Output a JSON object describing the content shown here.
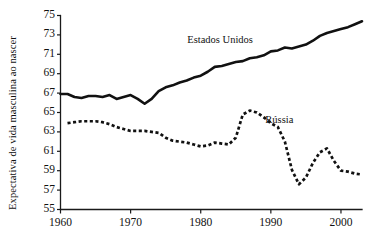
{
  "chart_data": {
    "type": "line",
    "title": "",
    "xlabel": "",
    "ylabel": "Expectativa de vida masculina ao nascer",
    "xlim": [
      1960,
      2003
    ],
    "ylim": [
      55,
      75
    ],
    "grid": false,
    "legend_position": "inline-annotation",
    "x_ticks": [
      "1960",
      "1970",
      "1980",
      "1990",
      "2000"
    ],
    "x_tick_values": [
      1960,
      1970,
      1980,
      1990,
      2000
    ],
    "y_ticks": [
      "55",
      "57",
      "59",
      "61",
      "63",
      "65",
      "67",
      "69",
      "71",
      "73",
      "75"
    ],
    "y_tick_values": [
      55,
      57,
      59,
      61,
      63,
      65,
      67,
      69,
      71,
      73,
      75
    ],
    "series": [
      {
        "name": "Estados Unidos",
        "style": "solid",
        "color": "#111111",
        "label_x": 1983.5,
        "label_y": 72.4,
        "x": [
          1960,
          1961,
          1962,
          1963,
          1964,
          1965,
          1966,
          1967,
          1968,
          1969,
          1970,
          1971,
          1972,
          1973,
          1974,
          1975,
          1976,
          1977,
          1978,
          1979,
          1980,
          1981,
          1982,
          1983,
          1984,
          1985,
          1986,
          1987,
          1988,
          1989,
          1990,
          1991,
          1992,
          1993,
          1994,
          1995,
          1996,
          1997,
          1998,
          1999,
          2000,
          2001,
          2002,
          2003
        ],
        "values": [
          66.9,
          66.9,
          66.6,
          66.5,
          66.7,
          66.7,
          66.6,
          66.8,
          66.4,
          66.6,
          66.8,
          66.4,
          65.9,
          66.4,
          67.2,
          67.6,
          67.8,
          68.1,
          68.3,
          68.6,
          68.8,
          69.2,
          69.7,
          69.8,
          70.0,
          70.2,
          70.3,
          70.6,
          70.7,
          70.9,
          71.3,
          71.4,
          71.7,
          71.6,
          71.8,
          72.0,
          72.4,
          72.9,
          73.2,
          73.4,
          73.6,
          73.8,
          74.1,
          74.4
        ],
        "start_value": 66.9,
        "end_value": 74.4,
        "min_value": 65.9,
        "max_value": 74.4
      },
      {
        "name": "Rússia",
        "style": "dashed",
        "color": "#111111",
        "label_x": 1991.5,
        "label_y": 64.1,
        "x": [
          1961,
          1962,
          1963,
          1964,
          1965,
          1966,
          1967,
          1968,
          1969,
          1970,
          1971,
          1972,
          1973,
          1974,
          1975,
          1976,
          1977,
          1978,
          1979,
          1980,
          1981,
          1982,
          1983,
          1984,
          1985,
          1986,
          1987,
          1988,
          1989,
          1990,
          1991,
          1992,
          1993,
          1994,
          1995,
          1996,
          1997,
          1998,
          1999,
          2000,
          2001,
          2002,
          2003
        ],
        "values": [
          63.9,
          64.0,
          64.1,
          64.1,
          64.1,
          64.0,
          63.8,
          63.5,
          63.3,
          63.1,
          63.1,
          63.1,
          63.0,
          62.9,
          62.4,
          62.1,
          62.0,
          61.9,
          61.7,
          61.5,
          61.6,
          61.9,
          61.8,
          61.7,
          62.4,
          64.8,
          65.2,
          65.0,
          64.5,
          63.9,
          63.5,
          62.0,
          59.1,
          57.6,
          58.3,
          59.8,
          60.9,
          61.3,
          60.0,
          59.0,
          58.9,
          58.7,
          58.6
        ],
        "start_value": 63.9,
        "end_value": 58.6,
        "min_value": 57.6,
        "max_value": 65.2
      }
    ]
  },
  "axes": {
    "y_axis_title": "Expectativa de vida masculina ao nascer"
  },
  "annotations": {
    "us_label": "Estados Unidos",
    "russia_label": "Rússia"
  }
}
